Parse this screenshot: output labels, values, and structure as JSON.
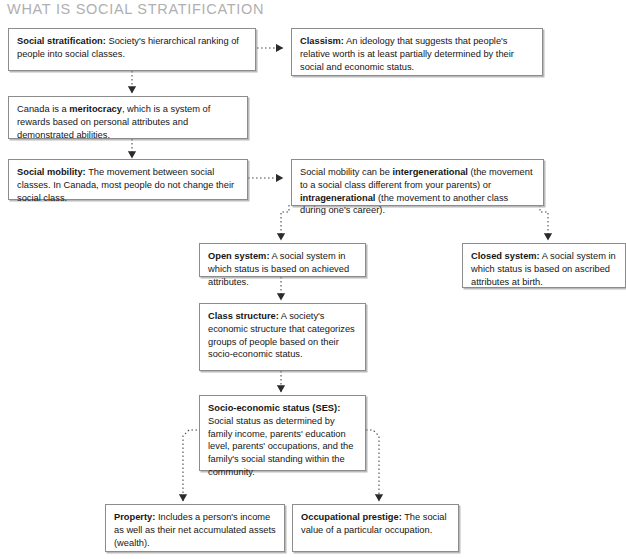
{
  "title": "WHAT IS SOCIAL STRATIFICATION",
  "theme": {
    "background": "#ffffff",
    "box_border": "#8c8c8c",
    "box_fill": "#ffffff",
    "title_color": "#b0b0b0",
    "text_color": "#161616",
    "connector_color": "#4d4d4d"
  },
  "nodes": {
    "social_stratification": {
      "term": "Social stratification:",
      "text": " Society's hierarchical ranking of people into social classes."
    },
    "classism": {
      "term": "Classism:",
      "text": " An ideology that suggests that people's relative worth is at least partially determined by their social and economic status."
    },
    "meritocracy": {
      "pre": "Canada is a ",
      "term": "meritocracy",
      "text": ", which is a system of rewards based on personal attributes and demonstrated abilities."
    },
    "social_mobility": {
      "term": "Social mobility:",
      "text": " The movement between social classes. In Canada, most people do not change their social class."
    },
    "mobility_types": {
      "pre": "Social mobility can be ",
      "term1": "intergenerational",
      "mid": " (the movement to a social class different from your parents) or ",
      "term2": "intragenerational",
      "post": " (the movement to another class during one's career)."
    },
    "open_system": {
      "term": "Open system:",
      "text": " A social system in which status is based on achieved attributes."
    },
    "closed_system": {
      "term": "Closed system:",
      "text": " A social system in which status is based on ascribed attributes at birth."
    },
    "class_structure": {
      "term": "Class structure:",
      "text": " A society's economic structure that categorizes groups of people based on their socio-economic status."
    },
    "ses": {
      "term": "Socio-economic status (SES):",
      "text": " Social status as determined by family income, parents' education level, parents' occupations, and the family's social standing within the community."
    },
    "property": {
      "term": "Property:",
      "text": " Includes a person's income as well as their net accumulated assets (wealth)."
    },
    "occupational_prestige": {
      "term": "Occupational prestige:",
      "text": " The social value of a particular occupation."
    }
  },
  "connectors": [
    {
      "name": "stratification-to-classism",
      "style": "dotted-arrow"
    },
    {
      "name": "stratification-to-meritocracy",
      "style": "dotted-arrow"
    },
    {
      "name": "meritocracy-to-social-mobility",
      "style": "dotted-arrow"
    },
    {
      "name": "social-mobility-to-mobility-types",
      "style": "dotted-arrow"
    },
    {
      "name": "mobility-types-to-open-system",
      "style": "dotted-arrow"
    },
    {
      "name": "mobility-types-to-closed-system",
      "style": "dotted-arrow"
    },
    {
      "name": "open-system-to-class-structure",
      "style": "dotted-arrow"
    },
    {
      "name": "class-structure-to-ses",
      "style": "dotted-arrow"
    },
    {
      "name": "ses-to-property",
      "style": "dotted-arrow"
    },
    {
      "name": "ses-to-occupational-prestige",
      "style": "dotted-arrow"
    }
  ]
}
